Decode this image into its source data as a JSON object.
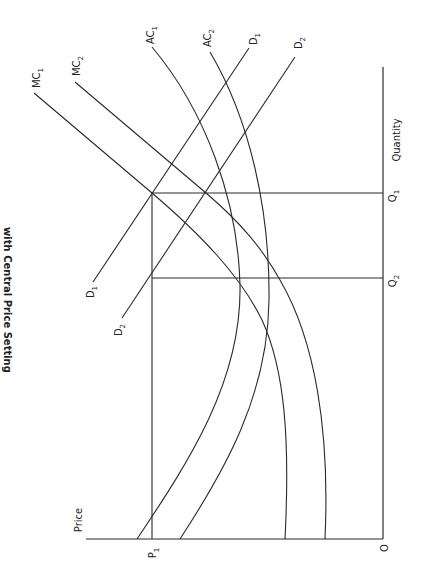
{
  "diagram": {
    "title": "with Central Price Setting",
    "orientation": "rotated-90-clockwise",
    "axes": {
      "x_label": "Quantity",
      "y_label": "Price",
      "origin_label": "O"
    },
    "markers": {
      "p1": {
        "base": "P",
        "sub": "1"
      },
      "q1": {
        "base": "Q",
        "sub": "1"
      },
      "q2": {
        "base": "Q",
        "sub": "2"
      }
    },
    "curves": {
      "mc1": {
        "base": "MC",
        "sub": "1"
      },
      "mc2": {
        "base": "MC",
        "sub": "2"
      },
      "ac1": {
        "base": "AC",
        "sub": "1"
      },
      "ac2": {
        "base": "AC",
        "sub": "2"
      },
      "d1_top": {
        "base": "D",
        "sub": "1"
      },
      "d2_top": {
        "base": "D",
        "sub": "2"
      },
      "d1_bottom": {
        "base": "D",
        "sub": "1"
      },
      "d2_bottom": {
        "base": "D",
        "sub": "2"
      }
    },
    "colors": {
      "ink": "#2a2a2a",
      "background": "#ffffff"
    }
  }
}
